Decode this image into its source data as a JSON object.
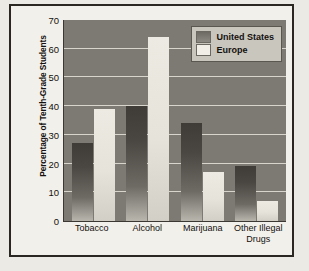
{
  "chart_data": {
    "type": "bar",
    "title": "",
    "xlabel": "",
    "ylabel": "Percentage of Tenth-Grade Students",
    "categories": [
      "Tobacco",
      "Alcohol",
      "Marijuana",
      "Other Illegal Drugs"
    ],
    "series": [
      {
        "name": "United States",
        "values": [
          27,
          40,
          34,
          19
        ],
        "color": "#4a4742"
      },
      {
        "name": "Europe",
        "values": [
          39,
          64,
          17,
          7
        ],
        "color": "#eceae2"
      }
    ],
    "ylim": [
      0,
      70
    ],
    "ytick_values": [
      70,
      60,
      50,
      40,
      30,
      20,
      10,
      0
    ],
    "grid": true,
    "legend_position": "top-right",
    "plot_background": "#7d7a74",
    "figure_background": "#f2f0ea",
    "border_color": "#2a2723"
  },
  "axis": {
    "y_title": "Percentage of Tenth-Grade Students"
  },
  "legend": {
    "entries": [
      {
        "label": "United States"
      },
      {
        "label": "Europe"
      }
    ]
  }
}
